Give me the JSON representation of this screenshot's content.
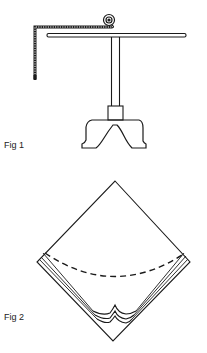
{
  "figures": [
    {
      "id": "fig1",
      "label": "Fig 1",
      "description": "T-shaped stand with footed base holding a horizontal bar; an L-shaped measuring tape hangs from a coiled end over the bar"
    },
    {
      "id": "fig2",
      "label": "Fig 2",
      "description": "Diamond-shaped folded sheet with a dashed curved fold line and layered scalloped edges near the bottom corner"
    }
  ],
  "colors": {
    "ink": "#1a1a1a",
    "background": "#ffffff"
  }
}
